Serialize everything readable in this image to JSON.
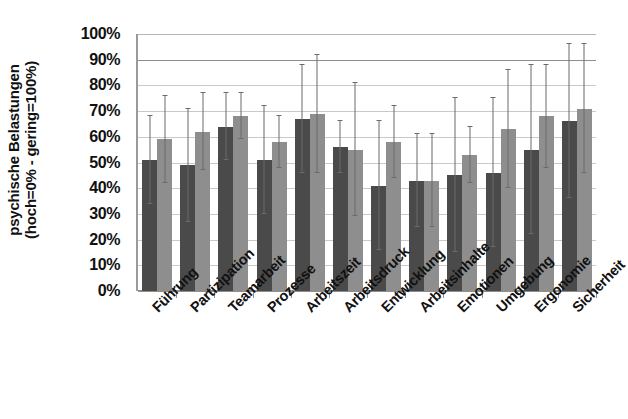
{
  "chart_data": {
    "type": "bar",
    "title": "",
    "xlabel": "",
    "ylabel": "psychische Belastungen (hoch=0% - gering=100%)",
    "ylabel_line1": "psychische Belastungen",
    "ylabel_line2": "(hoch=0% - gering=100%)",
    "ylim": [
      0,
      100
    ],
    "ytick_labels": [
      "100%",
      "90%",
      "80%",
      "70%",
      "60%",
      "50%",
      "40%",
      "30%",
      "20%",
      "10%",
      "0%"
    ],
    "ytick_values": [
      100,
      90,
      80,
      70,
      60,
      50,
      40,
      30,
      20,
      10,
      0
    ],
    "grid": true,
    "legend": "none",
    "categories": [
      "Führung",
      "Partizipation",
      "Teamarbeit",
      "Prozesse",
      "Arbeitszeit",
      "Arbeitsdruck",
      "Entwicklung",
      "Arbeitsinhalte",
      "Emotionen",
      "Umgebung",
      "Ergonomie",
      "Sicherheit"
    ],
    "series": [
      {
        "name": "Serie 1",
        "color": "#4a4a4a",
        "values": [
          51,
          49,
          64,
          51,
          67,
          56,
          41,
          43,
          45,
          46,
          55,
          66
        ],
        "err_upper": [
          68,
          71,
          77,
          72,
          88,
          66,
          66,
          61,
          75,
          75,
          88,
          96
        ],
        "err_lower": [
          34,
          27,
          51,
          30,
          46,
          46,
          16,
          25,
          15,
          17,
          22,
          36
        ]
      },
      {
        "name": "Serie 2",
        "color": "#8e8e8e",
        "values": [
          59,
          62,
          68,
          58,
          69,
          55,
          58,
          43,
          53,
          63,
          68,
          71
        ],
        "err_upper": [
          76,
          77,
          77,
          68,
          92,
          81,
          72,
          61,
          64,
          86,
          88,
          96
        ],
        "err_lower": [
          42,
          47,
          59,
          48,
          46,
          29,
          44,
          25,
          42,
          40,
          48,
          46
        ]
      }
    ]
  }
}
